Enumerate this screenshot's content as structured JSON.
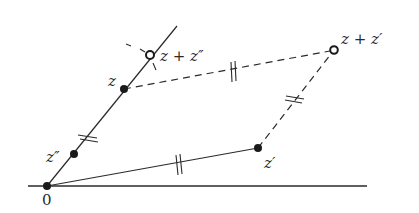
{
  "diagram": {
    "colors": {
      "stroke": "#2a2a2a",
      "background": "#ffffff"
    },
    "points": {
      "origin": {
        "label": "0",
        "x": 47,
        "y": 186
      },
      "z": {
        "label": "z",
        "x": 124,
        "y": 89
      },
      "z_double_prime": {
        "label": "z″",
        "x": 74,
        "y": 154
      },
      "z_prime": {
        "label": "z′",
        "x": 258,
        "y": 148
      },
      "z_plus_z_prime": {
        "label": "z + z′",
        "x": 334,
        "y": 50
      },
      "z_plus_z_double_prime": {
        "label": "z + z″",
        "x": 150,
        "y": 55
      }
    },
    "lines": {
      "real_axis": {
        "x1": 28,
        "y1": 186,
        "x2": 367,
        "y2": 186,
        "style": "solid"
      },
      "ray_through_z": {
        "x1": 47,
        "y1": 186,
        "x2": 177,
        "y2": 26,
        "style": "solid"
      },
      "origin_to_z_prime": {
        "x1": 47,
        "y1": 186,
        "x2": 258,
        "y2": 148,
        "style": "solid"
      },
      "z_to_z_plus_z_prime": {
        "style": "dashed"
      },
      "z_prime_to_z_plus_z_prime": {
        "style": "dashed"
      }
    },
    "tick_marks": "double ticks (∥) mark equal-length segments"
  }
}
